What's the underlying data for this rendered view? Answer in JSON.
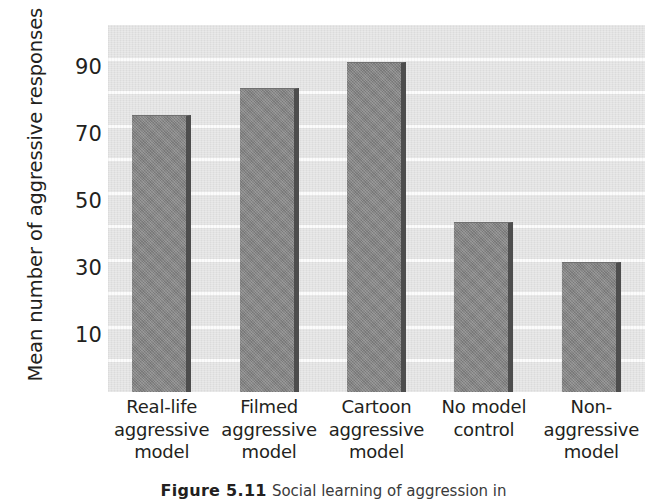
{
  "chart_data": {
    "type": "bar",
    "title": "",
    "xlabel": "",
    "ylabel": "Mean number of aggressive responses",
    "categories": [
      "Real-life aggressive model",
      "Filmed aggressive model",
      "Cartoon aggressive model",
      "No model control",
      "Non-aggressive model"
    ],
    "category_lines": [
      [
        "Real-life",
        "aggressive",
        "model"
      ],
      [
        "Filmed",
        "aggressive",
        "model"
      ],
      [
        "Cartoon",
        "aggressive",
        "model"
      ],
      [
        "No model",
        "control"
      ],
      [
        "Non-",
        "aggressive",
        "model"
      ]
    ],
    "values": [
      83,
      91,
      99,
      51,
      39
    ],
    "ylim": [
      0,
      110
    ],
    "ytick_labels": [
      "10",
      "30",
      "50",
      "70",
      "90"
    ],
    "ytick_values": [
      10,
      30,
      50,
      70,
      90
    ],
    "gridlines_at": [
      10,
      20,
      30,
      40,
      50,
      60,
      70,
      80,
      90,
      100
    ],
    "grid": true,
    "legend": "none"
  },
  "style": {
    "bar_color": "#858585",
    "bar_shadow_color": "#4d4d4d",
    "panel_color": "#e3e3e3",
    "gridline_color": "#fbfbfb",
    "text_color": "#231f20",
    "page_color": "#ffffff"
  },
  "caption": {
    "figure_number": "Figure 5.11",
    "text": "Social learning of aggression in"
  }
}
